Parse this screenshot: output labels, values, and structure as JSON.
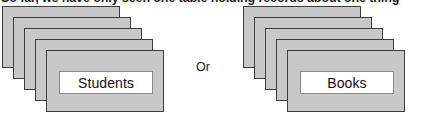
{
  "caption": {
    "text": "So far, we have only seen one table holding records about one thing"
  },
  "diagram": {
    "connector_label": "Or",
    "stacks": [
      {
        "id": "students-stack",
        "label": "Students",
        "card_count": 5,
        "side": "left"
      },
      {
        "id": "books-stack",
        "label": "Books",
        "card_count": 5,
        "side": "right"
      }
    ]
  },
  "colors": {
    "card_fill": "#c8c8c8",
    "card_border": "#3c3c3c",
    "label_fill": "#ffffff",
    "label_border": "#8a8a8a",
    "text": "#111111",
    "background": "#ffffff"
  }
}
